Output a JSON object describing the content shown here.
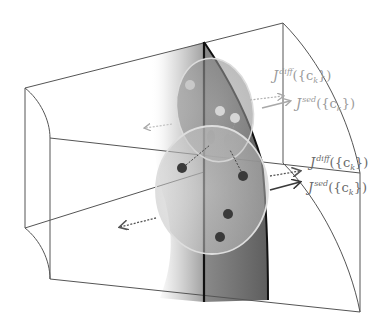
{
  "diagram": {
    "title": "",
    "colors": {
      "frame_line": "#555555",
      "interface_line": "#111111",
      "dark_band": "#6e6e6e",
      "particle": "#3a3a3a",
      "particle_faded": "#d4d4d4",
      "label_faded": "#9a9a9a",
      "label_strong": "#6a6a6a",
      "ellipse_outline": "#dcdcdc"
    },
    "labels": [
      {
        "id": "upper-diff",
        "symbol": "J",
        "superscript": "diff",
        "arg": "({c",
        "sub": "k",
        "close": "})",
        "style": "faded"
      },
      {
        "id": "upper-sed",
        "symbol": "J",
        "superscript": "sed",
        "arg": "({c",
        "sub": "k",
        "close": "})",
        "style": "faded"
      },
      {
        "id": "lower-diff",
        "symbol": "J",
        "superscript": "diff",
        "arg": "({c",
        "sub": "k",
        "close": "})",
        "style": "strong"
      },
      {
        "id": "lower-sed",
        "symbol": "J",
        "superscript": "sed",
        "arg": "({c",
        "sub": "k",
        "close": "})",
        "style": "strong"
      }
    ],
    "arrows": [
      {
        "name": "upper-diff-flux-arrow",
        "style": "dotted",
        "shade": "faded"
      },
      {
        "name": "upper-sed-flux-arrow",
        "style": "solid",
        "shade": "faded"
      },
      {
        "name": "lower-diff-flux-arrow",
        "style": "dotted",
        "shade": "strong"
      },
      {
        "name": "lower-sed-flux-arrow",
        "style": "solid",
        "shade": "strong"
      },
      {
        "name": "upper-left-backflow-arrow",
        "style": "dotted",
        "shade": "faded"
      },
      {
        "name": "lower-left-backflow-arrow",
        "style": "dotted",
        "shade": "strong"
      }
    ],
    "particles": {
      "lower_cluster_count": 5,
      "upper_cluster_count": 4
    }
  }
}
